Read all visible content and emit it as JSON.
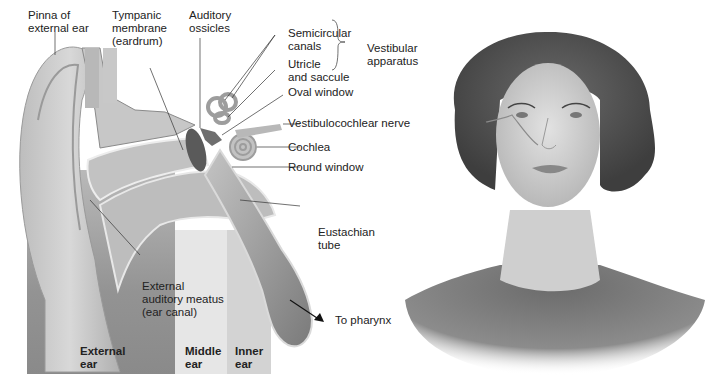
{
  "figure": {
    "left_panel": {
      "title": "Anatomy of the human ear",
      "labels": {
        "pinna": "Pinna of\nexternal ear",
        "tympanic": "Tympanic\nmembrane\n(eardrum)",
        "ossicles": "Auditory\nossicles",
        "semicircular": "Semicircular\ncanals",
        "utricle": "Utricle\nand saccule",
        "vestibular": "Vestibular\napparatus",
        "oval_window": "Oval window",
        "vestibulocochlear": "Vestibulocochlear nerve",
        "cochlea": "Cochlea",
        "round_window": "Round window",
        "eustachian": "Eustachian\ntube",
        "meatus": "External\nauditory meatus\n(ear canal)",
        "pharynx": "To pharynx"
      },
      "zones": [
        {
          "name": "External\near",
          "color": "#8e8e8e"
        },
        {
          "name": "Middle\near",
          "color": "#e4e4e4"
        },
        {
          "name": "Inner\near",
          "color": "#cfcfcf"
        }
      ]
    },
    "right_panel": {
      "description": "Illustration of a woman's head and shoulders showing ear location"
    },
    "colors": {
      "background": "#ffffff",
      "label_text": "#222222",
      "leader_line": "#333333",
      "tissue_light": "#c9c9c9",
      "tissue_mid": "#a8a8a8",
      "tissue_dark": "#6f6f6f"
    }
  }
}
